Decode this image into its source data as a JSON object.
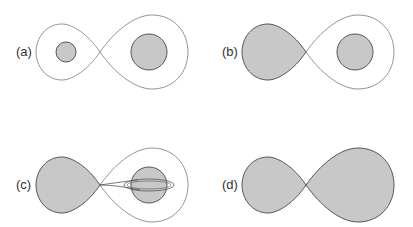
{
  "figure": {
    "panels": [
      {
        "id": "a",
        "label": "(a)",
        "description": "Detached binary: both stars within Roche lobes"
      },
      {
        "id": "b",
        "label": "(b)",
        "description": "Semi-detached: left star fills its Roche lobe"
      },
      {
        "id": "c",
        "label": "(c)",
        "description": "Mass transfer stream to accretion disk around companion"
      },
      {
        "id": "d",
        "label": "(d)",
        "description": "Contact binary: both stars fill Roche lobes"
      }
    ],
    "colors": {
      "fill": "#c8c8c8",
      "stroke": "#555555",
      "outline": "#888888"
    }
  }
}
